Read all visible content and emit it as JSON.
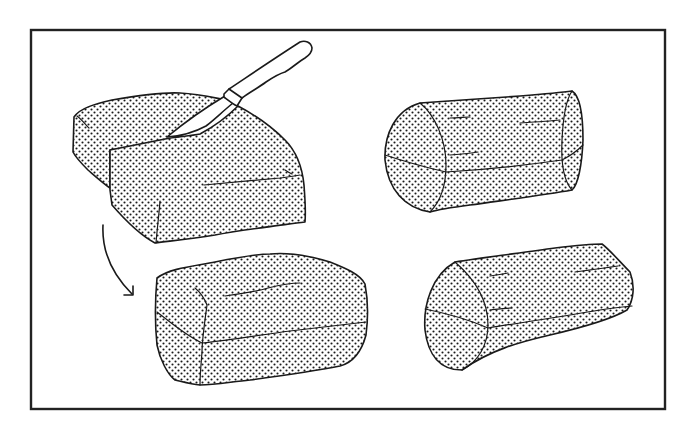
{
  "figure": {
    "colors": {
      "background": "#ffffff",
      "ink": "#1a1a1a",
      "frame": "#222222"
    },
    "frame": {
      "x": 31,
      "y": 30,
      "width": 634,
      "height": 379
    },
    "panels": [
      {
        "id": "block-with-knife",
        "label": "Dough block being cut with knife",
        "position": "top-left"
      },
      {
        "id": "rectangular-loaf",
        "label": "Shaped rectangular loaf",
        "position": "bottom-center"
      },
      {
        "id": "cylinder-log-top",
        "label": "Rolled cylindrical log",
        "position": "top-right"
      },
      {
        "id": "cylinder-log-bottom",
        "label": "Rolled cylindrical log",
        "position": "bottom-right"
      }
    ],
    "icons": {
      "knife": "knife-icon",
      "arrow": "curved-arrow-icon"
    }
  }
}
